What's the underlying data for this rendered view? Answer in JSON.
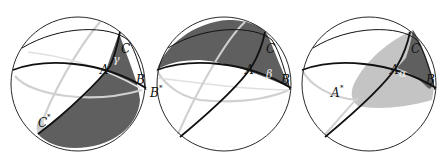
{
  "figure": {
    "colors": {
      "dark_fill": "#5f5f5f",
      "light_fill": "#c4c4c4",
      "outline": "#111111",
      "back_arc": "#cfcfcf"
    },
    "panels": [
      {
        "id": "gamma",
        "labels": {
          "A": "A",
          "B": "B",
          "C": "C",
          "antipode": "C",
          "antipode_mark": "*",
          "angle": "γ"
        }
      },
      {
        "id": "beta",
        "labels": {
          "A": "A",
          "B": "B",
          "C": "C",
          "antipode": "B",
          "antipode_mark": "*",
          "angle": "β"
        }
      },
      {
        "id": "alpha",
        "labels": {
          "A": "A",
          "B": "B",
          "C": "C",
          "antipode": "A",
          "antipode_mark": "*",
          "angle": "α"
        }
      }
    ]
  }
}
